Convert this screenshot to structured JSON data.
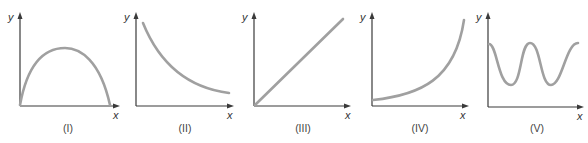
{
  "figure": {
    "curve_color": "#a0a0a0",
    "axis_color": "#3a3a3a",
    "panels": [
      {
        "id": "I",
        "caption": "(I)",
        "x_label": "x",
        "y_label": "y",
        "shape": "inverted parabola starting and ending on x-axis"
      },
      {
        "id": "II",
        "caption": "(II)",
        "x_label": "x",
        "y_label": "y",
        "shape": "decreasing decaying curve"
      },
      {
        "id": "III",
        "caption": "(III)",
        "x_label": "x",
        "y_label": "y",
        "shape": "straight line through origin, increasing"
      },
      {
        "id": "IV",
        "caption": "(IV)",
        "x_label": "x",
        "y_label": "y",
        "shape": "increasing exponential-like curve"
      },
      {
        "id": "V",
        "caption": "(V)",
        "x_label": "x",
        "y_label": "y",
        "shape": "oscillating wave with two troughs"
      }
    ]
  }
}
